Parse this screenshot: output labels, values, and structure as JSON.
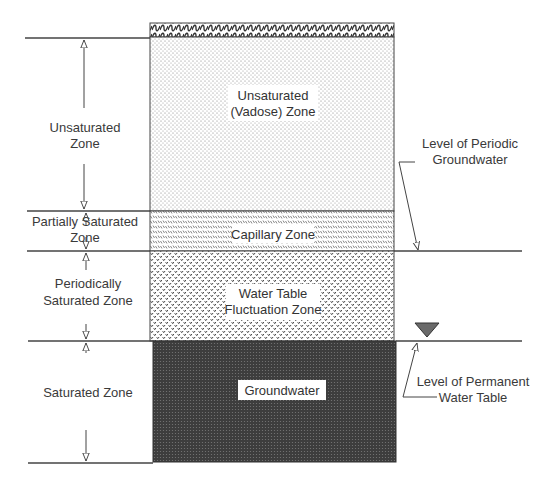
{
  "diagram": {
    "type": "soil-profile",
    "colors": {
      "line": "#444444",
      "groundwater": "#4a4a4a",
      "label_bg": "#ffffff",
      "water_table_marker": "#666666"
    },
    "column_zones": [
      {
        "id": "surface",
        "label": ""
      },
      {
        "id": "unsaturated",
        "label_line1": "Unsaturated",
        "label_line2": "(Vadose) Zone"
      },
      {
        "id": "capillary",
        "label": "Capillary Zone"
      },
      {
        "id": "fluctuation",
        "label_line1": "Water Table",
        "label_line2": "Fluctuation Zone"
      },
      {
        "id": "groundwater",
        "label": "Groundwater"
      }
    ],
    "left_labels": {
      "unsaturated_line1": "Unsaturated",
      "unsaturated_line2": "Zone",
      "partial_line1": "Partially Saturated",
      "partial_line2": "Zone",
      "periodic_line1": "Periodically",
      "periodic_line2": "Saturated Zone",
      "saturated": "Saturated Zone"
    },
    "right_labels": {
      "periodic_gw_line1": "Level of Periodic",
      "periodic_gw_line2": "Groundwater",
      "permanent_wt_line1": "Level of Permanent",
      "permanent_wt_line2": "Water Table"
    }
  }
}
